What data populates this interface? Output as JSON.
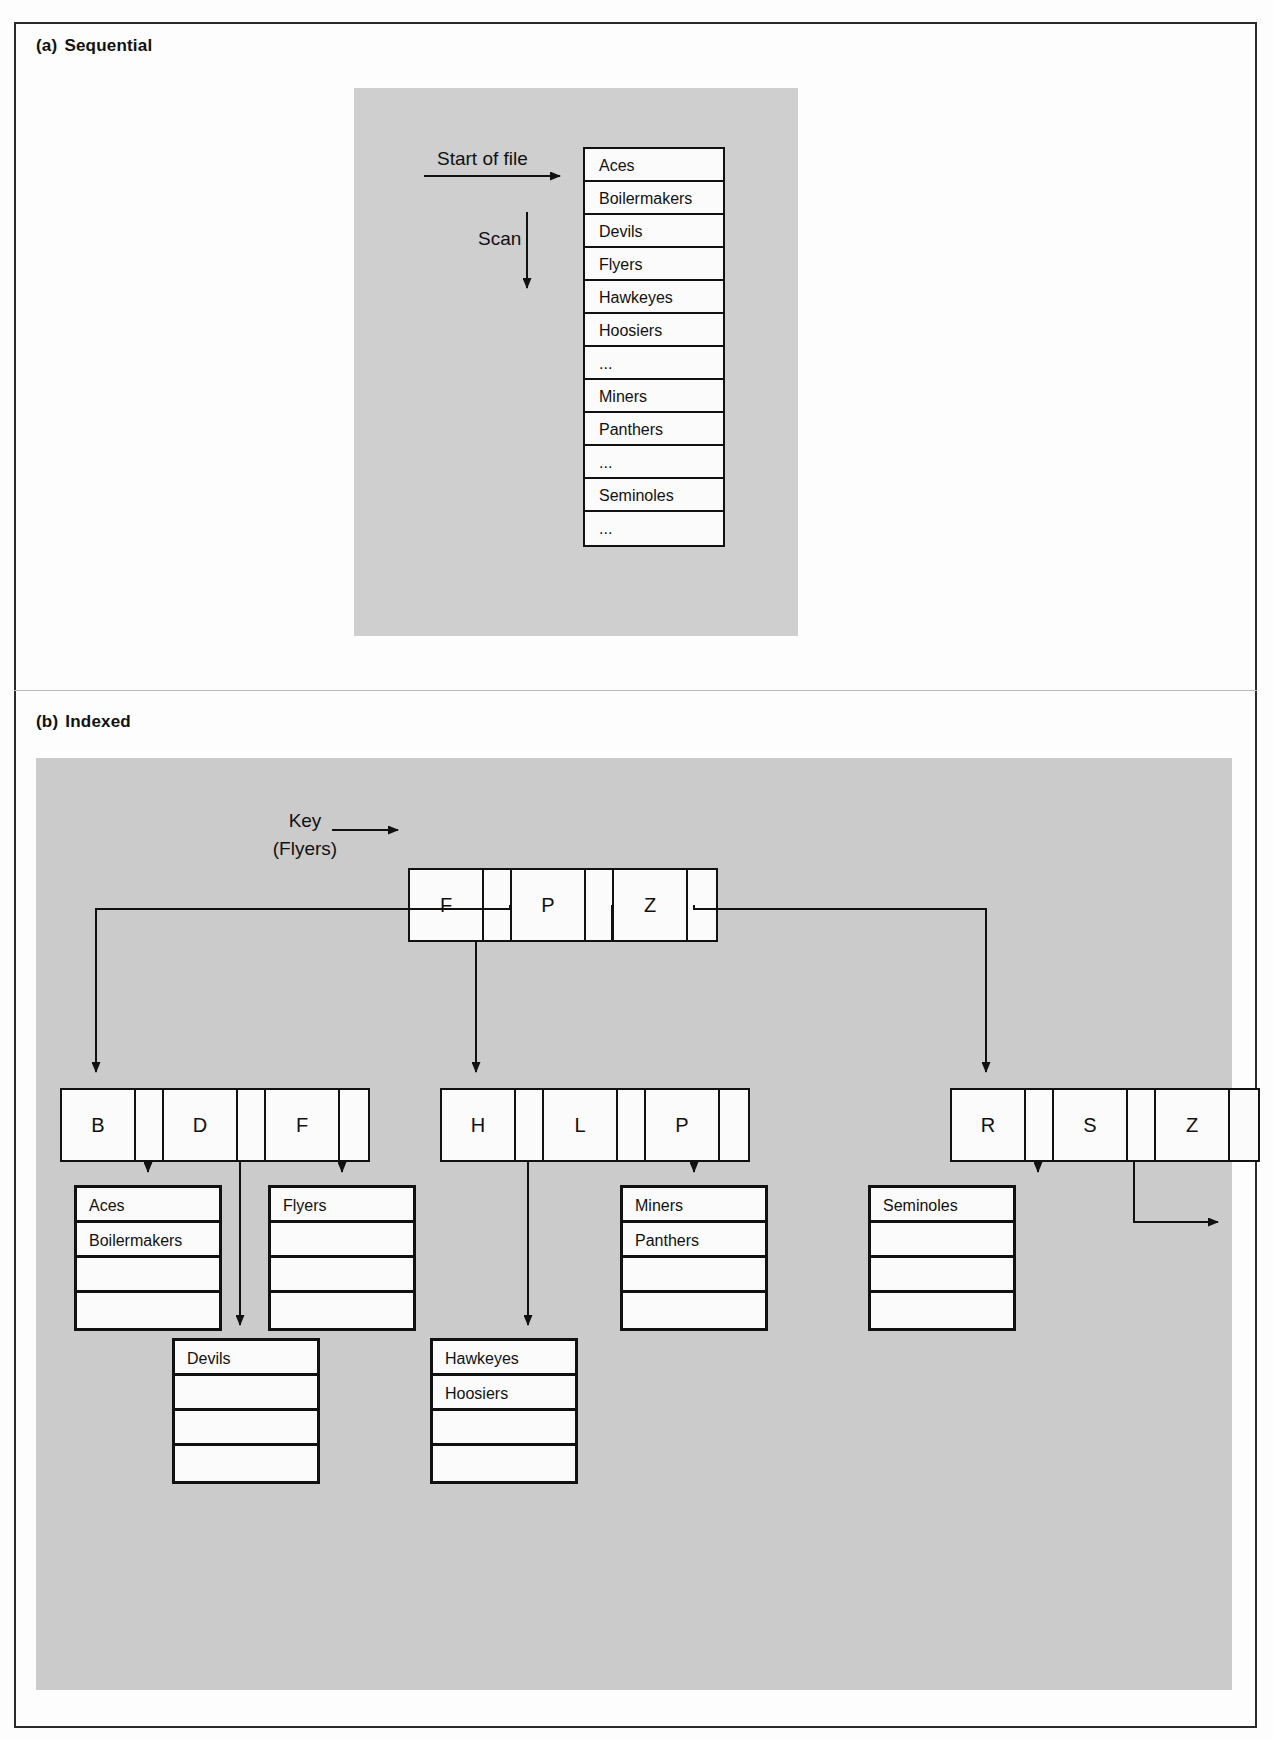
{
  "figure": {
    "part_a": {
      "tag": "(a)",
      "label": "Sequential"
    },
    "part_b": {
      "tag": "(b)",
      "label": "Indexed"
    }
  },
  "sequential": {
    "arrow_label": "Start of file",
    "scan_label": "Scan",
    "records": [
      "Aces",
      "Boilermakers",
      "Devils",
      "Flyers",
      "Hawkeyes",
      "Hoosiers",
      "...",
      "Miners",
      "Panthers",
      "...",
      "Seminoles",
      "..."
    ]
  },
  "indexed": {
    "key_label_line1": "Key",
    "key_label_line2": "(Flyers)",
    "root_node": {
      "keys": [
        "F",
        "P",
        "Z"
      ]
    },
    "level2_nodes": [
      {
        "keys": [
          "B",
          "D",
          "F"
        ]
      },
      {
        "keys": [
          "H",
          "L",
          "P"
        ]
      },
      {
        "keys": [
          "R",
          "S",
          "Z"
        ]
      }
    ],
    "leaf_blocks": [
      {
        "rows": [
          "Aces",
          "Boilermakers",
          "",
          ""
        ]
      },
      {
        "rows": [
          "Flyers",
          "",
          "",
          ""
        ]
      },
      {
        "rows": [
          "Miners",
          "Panthers",
          "",
          ""
        ]
      },
      {
        "rows": [
          "Seminoles",
          "",
          "",
          ""
        ]
      },
      {
        "rows": [
          "Devils",
          "",
          "",
          ""
        ]
      },
      {
        "rows": [
          "Hawkeyes",
          "Hoosiers",
          "",
          ""
        ]
      }
    ]
  },
  "colors": {
    "panel_gray": "#cfcfcf",
    "ink": "#111111",
    "page": "#fdfdfd"
  }
}
